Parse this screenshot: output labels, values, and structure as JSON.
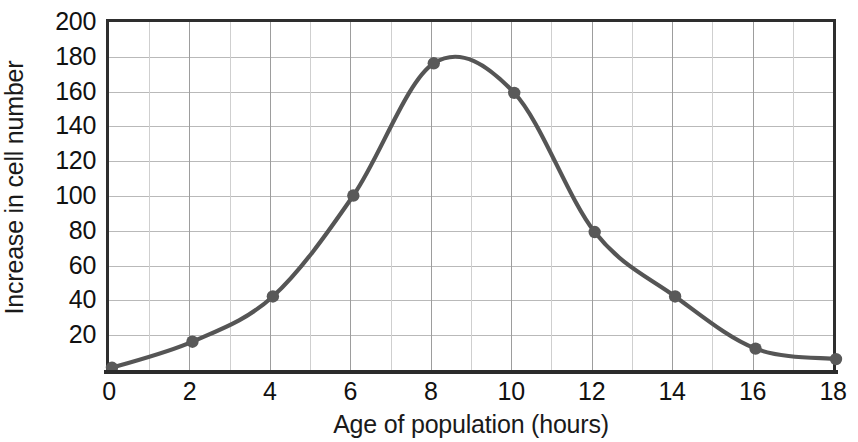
{
  "chart_data": {
    "type": "line",
    "title": "",
    "xlabel": "Age of population (hours)",
    "ylabel": "Increase in cell number",
    "xlim": [
      0,
      18
    ],
    "ylim": [
      0,
      200
    ],
    "grid": true,
    "legend": "none",
    "marker": "filled-circle",
    "line_color": "#555555",
    "marker_color": "#595959",
    "axis_color": "#2e2e2e",
    "grid_color": "#b9b9b9",
    "x_major_step": 2,
    "x_minor_step": 1,
    "y_major_step": 20,
    "x_tick_labels": [
      "0",
      "2",
      "4",
      "6",
      "8",
      "10",
      "12",
      "14",
      "16",
      "18"
    ],
    "y_tick_labels": [
      "20",
      "40",
      "60",
      "80",
      "100",
      "120",
      "140",
      "160",
      "180",
      "200"
    ],
    "x": [
      0,
      2,
      4,
      6,
      8,
      10,
      12,
      14,
      16,
      18
    ],
    "values": [
      3,
      18,
      44,
      102,
      178,
      161,
      81,
      44,
      14,
      8
    ],
    "series": [
      {
        "name": "Increase in cell number",
        "x": [
          0,
          2,
          4,
          6,
          8,
          10,
          12,
          14,
          16,
          18
        ],
        "values": [
          3,
          18,
          44,
          102,
          178,
          161,
          81,
          44,
          14,
          8
        ]
      }
    ]
  }
}
